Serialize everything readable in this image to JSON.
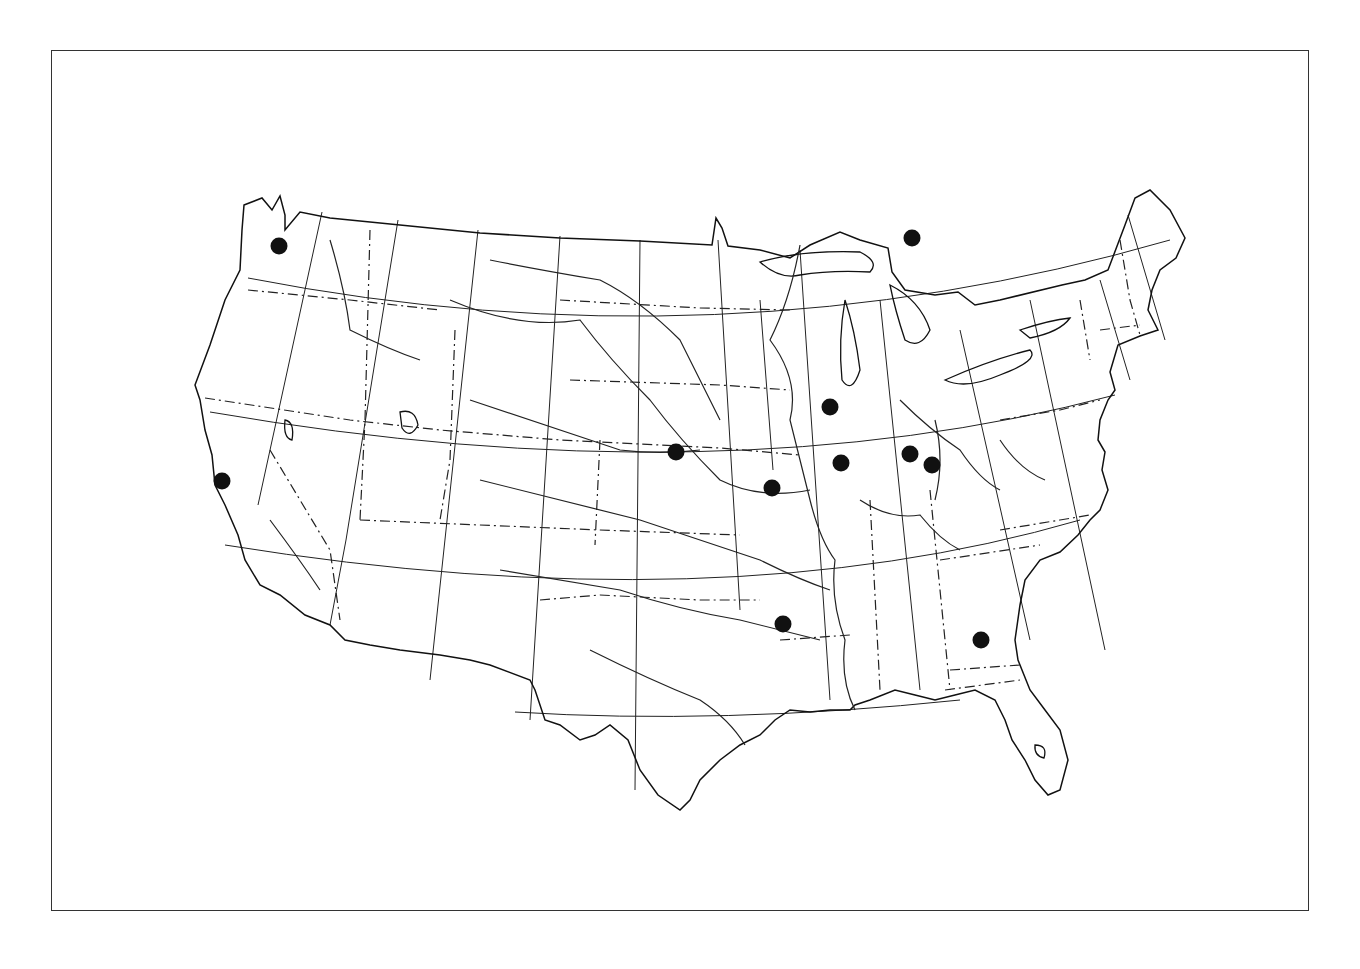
{
  "map": {
    "title": "",
    "region": "Contiguous United States",
    "frame": {
      "x": 51,
      "y": 50,
      "width": 1258,
      "height": 861
    },
    "style": {
      "line_color": "#111111",
      "dot_color": "#111111",
      "background": "#ffffff"
    },
    "layers": [
      "graticule",
      "coastline",
      "state-boundaries",
      "rivers",
      "sites"
    ],
    "dot_diameter": 17,
    "sites": [
      {
        "id": "site-1",
        "approx_location": "Seattle, WA area",
        "x": 279,
        "y": 246
      },
      {
        "id": "site-2",
        "approx_location": "north of Lake Huron (Ontario)",
        "x": 912,
        "y": 238
      },
      {
        "id": "site-3",
        "approx_location": "San Francisco, CA area",
        "x": 222,
        "y": 481
      },
      {
        "id": "site-4",
        "approx_location": "central Nebraska",
        "x": 676,
        "y": 452
      },
      {
        "id": "site-5",
        "approx_location": "northern Illinois",
        "x": 830,
        "y": 407
      },
      {
        "id": "site-6",
        "approx_location": "central Illinois",
        "x": 841,
        "y": 463
      },
      {
        "id": "site-7",
        "approx_location": "Indiana / Ohio border",
        "x": 910,
        "y": 454
      },
      {
        "id": "site-8",
        "approx_location": "Cincinnati, OH area",
        "x": 932,
        "y": 465
      },
      {
        "id": "site-9",
        "approx_location": "Kansas City, MO area",
        "x": 772,
        "y": 488
      },
      {
        "id": "site-10",
        "approx_location": "SW Arkansas",
        "x": 783,
        "y": 624
      },
      {
        "id": "site-11",
        "approx_location": "central Georgia",
        "x": 981,
        "y": 640
      }
    ]
  }
}
